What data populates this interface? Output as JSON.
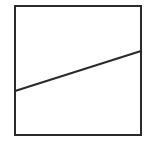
{
  "diagram": {
    "canvas": {
      "width": 159,
      "height": 150,
      "background": "#ffffff"
    },
    "square": {
      "x": 15,
      "y": 6,
      "width": 126,
      "height": 129,
      "stroke": "#2a2a2a",
      "stroke_width": 2
    },
    "line": {
      "x1": 15,
      "y1": 91,
      "x2": 141,
      "y2": 51,
      "stroke": "#2a2a2a",
      "stroke_width": 2
    }
  }
}
